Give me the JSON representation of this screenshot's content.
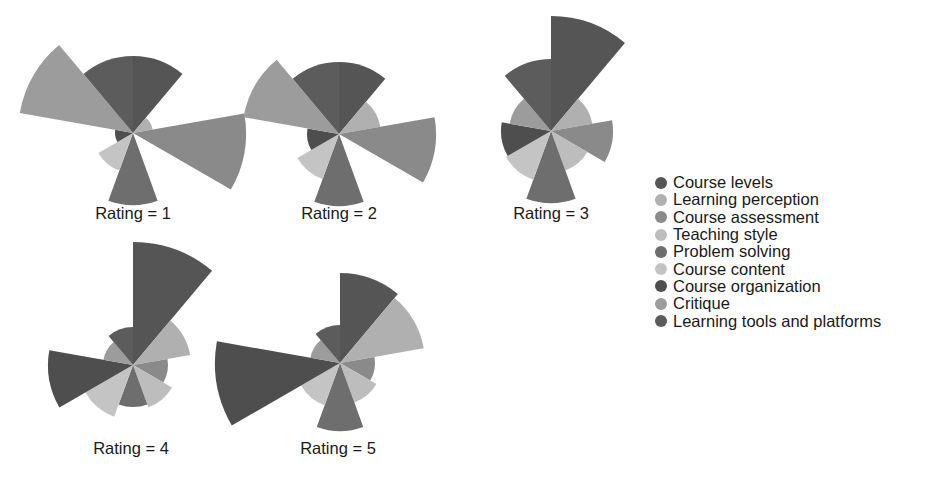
{
  "chart_data": {
    "type": "polar-bar",
    "title": "",
    "facet_variable": "Rating",
    "angular_unit": "degrees clockwise from top, 9 equal 40-degree sectors",
    "categories": [
      "Course levels",
      "Learning perception",
      "Course assessment",
      "Teaching style",
      "Problem solving",
      "Course content",
      "Course organization",
      "Critique",
      "Learning tools and platforms"
    ],
    "colors": [
      "#555555",
      "#b0b0b0",
      "#8a8a8a",
      "#bdbdbd",
      "#6e6e6e",
      "#c4c4c4",
      "#4e4e4e",
      "#9c9c9c",
      "#5c5c5c"
    ],
    "legend_position": "right",
    "panels": [
      {
        "label": "Rating = 1",
        "cx": 133,
        "cy": 133,
        "values": [
          77,
          20,
          113,
          0,
          72,
          40,
          18,
          115,
          77
        ]
      },
      {
        "label": "Rating = 2",
        "cx": 339,
        "cy": 134,
        "values": [
          72,
          42,
          97,
          0,
          72,
          48,
          32,
          97,
          72
        ]
      },
      {
        "label": "Rating = 3",
        "cx": 551,
        "cy": 131,
        "values": [
          115,
          42,
          62,
          42,
          72,
          52,
          50,
          42,
          72
        ]
      },
      {
        "label": "Rating = 4",
        "cx": 133,
        "cy": 365,
        "values": [
          123,
          58,
          35,
          45,
          42,
          55,
          85,
          30,
          38
        ]
      },
      {
        "label": "Rating = 5",
        "cx": 340,
        "cy": 363,
        "values": [
          90,
          85,
          35,
          42,
          68,
          45,
          125,
          30,
          38
        ]
      }
    ],
    "value_note": "values are relative radii (pixels) estimated from the figure; no radial axis shown"
  },
  "panel_titles": [
    "Rating = 1",
    "Rating = 2",
    "Rating = 3",
    "Rating = 4",
    "Rating = 5"
  ],
  "legend": {
    "items": [
      {
        "label": "Course levels",
        "color": "#555555"
      },
      {
        "label": "Learning perception",
        "color": "#b0b0b0"
      },
      {
        "label": "Course assessment",
        "color": "#8a8a8a"
      },
      {
        "label": "Teaching style",
        "color": "#bdbdbd"
      },
      {
        "label": "Problem solving",
        "color": "#6e6e6e"
      },
      {
        "label": "Course content",
        "color": "#c4c4c4"
      },
      {
        "label": "Course organization",
        "color": "#4e4e4e"
      },
      {
        "label": "Critique",
        "color": "#9c9c9c"
      },
      {
        "label": "Learning tools and platforms",
        "color": "#5c5c5c"
      }
    ]
  }
}
